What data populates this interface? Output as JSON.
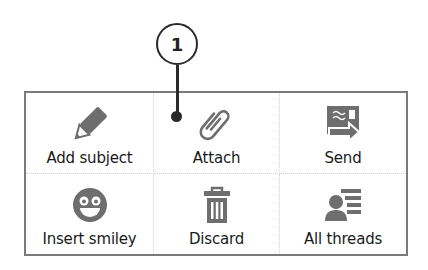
{
  "callout": {
    "number": "1"
  },
  "menu": {
    "items": [
      {
        "label": "Add subject",
        "icon": "pencil-icon"
      },
      {
        "label": "Attach",
        "icon": "paperclip-icon"
      },
      {
        "label": "Send",
        "icon": "send-icon"
      },
      {
        "label": "Insert smiley",
        "icon": "smiley-icon"
      },
      {
        "label": "Discard",
        "icon": "trash-icon"
      },
      {
        "label": "All threads",
        "icon": "threads-icon"
      }
    ]
  },
  "colors": {
    "icon": "#6e6e6e",
    "border": "#7a7a7a",
    "callout": "#2a2a2a"
  }
}
